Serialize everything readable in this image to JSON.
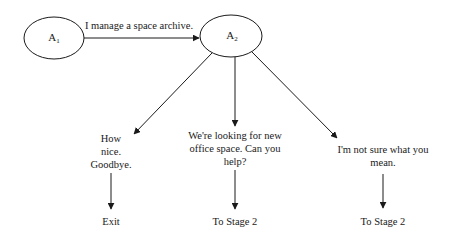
{
  "diagram": {
    "nodes": [
      {
        "id": "A1",
        "label_main": "A",
        "label_sub": "1"
      },
      {
        "id": "A2",
        "label_main": "A",
        "label_sub": "2"
      }
    ],
    "edge_a1_a2": {
      "label": "I manage a space archive."
    },
    "responses": [
      {
        "lines": [
          "How",
          "nice.",
          "Goodbye."
        ],
        "outcome": "Exit"
      },
      {
        "lines": [
          "We're looking for new",
          "office space.  Can you",
          "help?"
        ],
        "outcome": "To Stage 2"
      },
      {
        "lines": [
          "I'm not sure what you",
          "mean."
        ],
        "outcome": "To Stage 2"
      }
    ],
    "colors": {
      "line": "#1a1a1a",
      "background": "#ffffff"
    }
  }
}
